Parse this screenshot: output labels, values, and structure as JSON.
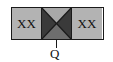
{
  "diagram": {
    "left_label": "XX",
    "right_label": "XX",
    "output_label": "Q",
    "colors": {
      "cell_fill": "#b3b3b3",
      "center_top": "#a8a8a8",
      "center_sides": "#3a3a3a",
      "center_bottom": "#6e6e6e",
      "stroke": "#1a1a1a"
    }
  }
}
